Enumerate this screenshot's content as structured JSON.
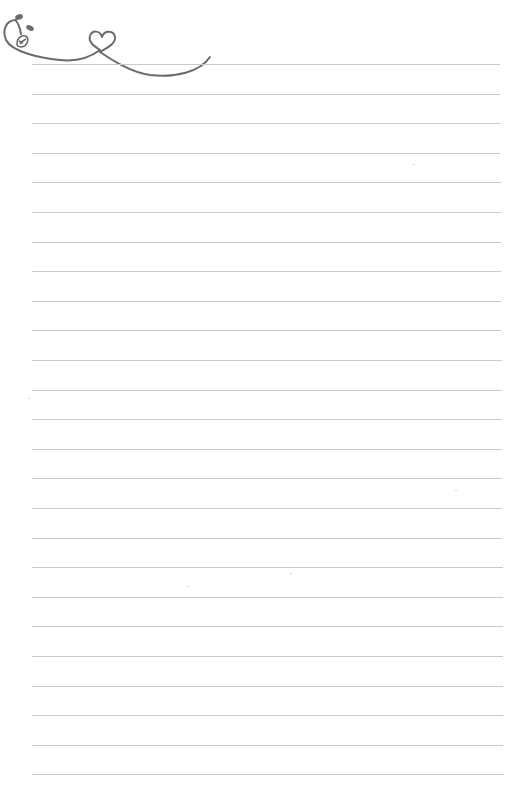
{
  "page": {
    "type": "lined-stationery",
    "background_color": "#ffffff",
    "rule_color": "#c9c9c9",
    "ornament_color": "#6b6b6b"
  },
  "ornament": {
    "icon": "rose-heart-flourish-icon",
    "elements": [
      "rose-bud",
      "leaves",
      "heart-loop",
      "swash-line"
    ]
  },
  "rules": {
    "count": 25,
    "first_y": 64,
    "spacing": 29.6,
    "x_start": 32,
    "x_end": 500
  },
  "lines": [
    "",
    "",
    "",
    "",
    "",
    "",
    "",
    "",
    "",
    "",
    "",
    "",
    "",
    "",
    "",
    "",
    "",
    "",
    "",
    "",
    "",
    "",
    "",
    "",
    ""
  ]
}
